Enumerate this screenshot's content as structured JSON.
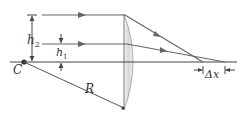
{
  "diagram": {
    "type": "spherical-aberration-plano-convex-lens",
    "labels": {
      "h2": "h",
      "h2_sub": "2",
      "h1": "h",
      "h1_sub": "1",
      "center": "C",
      "radius": "R",
      "delta_x": "Δx"
    },
    "colors": {
      "line": "#555555",
      "lens_fill": "#e4e4e4",
      "lens_edge": "#9a9a9a",
      "background": "#ffffff"
    }
  }
}
